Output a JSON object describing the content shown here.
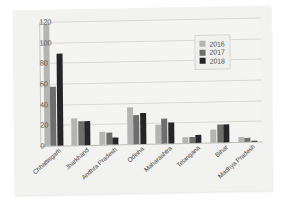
{
  "chart_data": {
    "type": "bar",
    "title": "",
    "subtitle": "",
    "xlabel": "",
    "ylabel": "",
    "ylim": [
      0,
      120
    ],
    "yticks": [
      0,
      20,
      40,
      60,
      80,
      100,
      120
    ],
    "grid": true,
    "legend_position": "top-right",
    "categories": [
      "Chhattisgarh",
      "Jharkhand",
      "Andhra Pradesh",
      "Odisha",
      "Maharashtra",
      "Telangana",
      "Bihar",
      "Madhya Pradesh"
    ],
    "series": [
      {
        "name": "2016",
        "color": "#b4b4b2",
        "values": [
          118,
          26,
          13,
          36,
          18,
          6,
          13,
          5
        ]
      },
      {
        "name": "2017",
        "color": "#6e6e6c",
        "values": [
          57,
          23,
          12,
          28,
          24,
          6,
          17,
          4
        ]
      },
      {
        "name": "2018",
        "color": "#26262a",
        "values": [
          89,
          23,
          7,
          30,
          20,
          8,
          17,
          1
        ]
      }
    ]
  },
  "legend": {
    "entries": [
      {
        "label": "2016",
        "color": "#b4b4b2"
      },
      {
        "label": "2017",
        "color": "#6e6e6c"
      },
      {
        "label": "2018",
        "color": "#26262a"
      }
    ]
  }
}
